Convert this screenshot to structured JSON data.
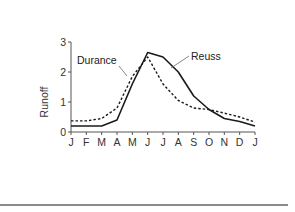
{
  "chart_data": {
    "type": "line",
    "title": "",
    "xlabel": "",
    "ylabel": "Runoff",
    "categories": [
      "J",
      "F",
      "M",
      "A",
      "M",
      "J",
      "J",
      "A",
      "S",
      "O",
      "N",
      "D",
      "J"
    ],
    "yticks": [
      0,
      1,
      2,
      3
    ],
    "ylim": [
      0,
      3
    ],
    "grid": false,
    "legend": "inline annotations",
    "series": [
      {
        "name": "Reuss",
        "style": "solid",
        "color": "#1a1a1a",
        "values": [
          0.2,
          0.2,
          0.2,
          0.4,
          1.6,
          2.65,
          2.5,
          2.0,
          1.2,
          0.75,
          0.45,
          0.35,
          0.2
        ]
      },
      {
        "name": "Durance",
        "style": "dashed",
        "color": "#1a1a1a",
        "values": [
          0.37,
          0.37,
          0.45,
          0.8,
          1.85,
          2.5,
          1.6,
          1.05,
          0.8,
          0.75,
          0.63,
          0.5,
          0.33
        ]
      }
    ],
    "annotations": [
      {
        "text": "Durance",
        "target": "Durance"
      },
      {
        "text": "Reuss",
        "target": "Reuss"
      }
    ]
  }
}
